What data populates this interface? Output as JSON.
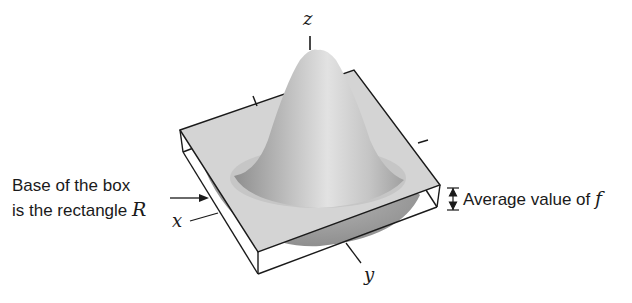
{
  "figure": {
    "axes": {
      "z_label": "z",
      "x_label": "x",
      "y_label": "y"
    },
    "annotations": {
      "base_line1": "Base of the box",
      "base_line2_text": "is the rectangle ",
      "base_line2_math": "R",
      "avg_text": "Average value of ",
      "avg_math": "f"
    },
    "colors": {
      "box_top": "#d4d4d4",
      "surface_light": "#d8d8d8",
      "surface_dark": "#9a9a9a",
      "under_surface": "#a6a6a6",
      "edges": "#1a1a1a"
    }
  }
}
